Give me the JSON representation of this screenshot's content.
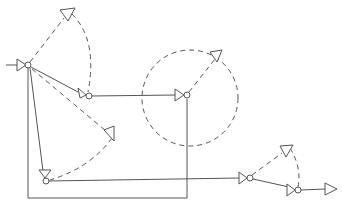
{
  "diagram": {
    "type": "directed-network",
    "colors": {
      "line": "#555555",
      "background": "#ffffff"
    },
    "nodes": [
      {
        "id": "n1",
        "x": 28,
        "y": 65,
        "kind": "valve-junction"
      },
      {
        "id": "n2",
        "x": 88,
        "y": 96,
        "kind": "valve-junction"
      },
      {
        "id": "n3",
        "x": 187,
        "y": 95,
        "kind": "valve-junction"
      },
      {
        "id": "n4",
        "x": 46,
        "y": 181,
        "kind": "valve-junction"
      },
      {
        "id": "n5",
        "x": 250,
        "y": 178,
        "kind": "valve-junction"
      },
      {
        "id": "n6",
        "x": 298,
        "y": 190,
        "kind": "valve-junction"
      }
    ],
    "terminals": [
      {
        "id": "t-top",
        "x": 68,
        "y": 14,
        "kind": "open-end"
      },
      {
        "id": "t-mid",
        "x": 110,
        "y": 136,
        "kind": "open-end"
      },
      {
        "id": "t-circle",
        "x": 217,
        "y": 55,
        "kind": "open-end"
      },
      {
        "id": "t-right",
        "x": 286,
        "y": 150,
        "kind": "open-end"
      },
      {
        "id": "t-out",
        "x": 332,
        "y": 189,
        "kind": "outlet"
      }
    ],
    "region": {
      "kind": "dashed-circle",
      "cx": 190,
      "cy": 98,
      "r": 48
    },
    "edges_solid": [
      {
        "from": "input",
        "to": "n1"
      },
      {
        "from": "n1",
        "to": "n2"
      },
      {
        "from": "n2",
        "to": "n3"
      },
      {
        "from": "n1",
        "to": "n4"
      },
      {
        "from": "n1",
        "to": "n3",
        "via": "bottom-loop"
      },
      {
        "from": "n4",
        "to": "n5"
      },
      {
        "from": "n5",
        "to": "n6"
      },
      {
        "from": "n6",
        "to": "t-out"
      }
    ],
    "edges_dashed": [
      {
        "from": "n1",
        "to": "t-top"
      },
      {
        "from": "t-top",
        "to": "n2"
      },
      {
        "from": "n1",
        "to": "t-mid"
      },
      {
        "from": "t-mid",
        "to": "n4"
      },
      {
        "from": "n3",
        "to": "t-circle"
      },
      {
        "from": "n5",
        "to": "t-right"
      },
      {
        "from": "t-right",
        "to": "n6"
      }
    ]
  }
}
